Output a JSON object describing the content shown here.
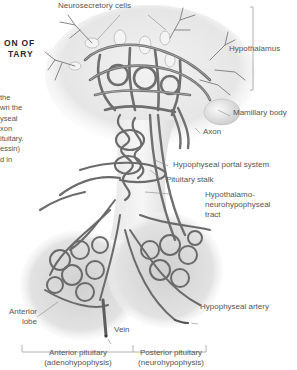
{
  "title": {
    "lines": [
      "ON OF",
      "TARY"
    ]
  },
  "body_text": {
    "lines": [
      "the",
      "wri the",
      "yseal",
      "xon",
      "ituitary.",
      "essin)",
      "d in"
    ]
  },
  "labels": {
    "neurosecretory_cells": "Neurosecretory cells",
    "hypothalamus": "Hypothalamus",
    "mamillary_body": "Mamillary body",
    "axon": "Axon",
    "hypophyseal_portal_system": "Hypophyseal portal system",
    "pituitary_stalk": "Pituitary stalk",
    "hypothalamo_tract": [
      "Hypothalamo-",
      "neurohypophyseal",
      "tract"
    ],
    "hypophyseal_artery": "Hypophyseal artery",
    "anterior_lobe": [
      "Anterior",
      "lobe"
    ],
    "vein": "Vein",
    "anterior_pituitary": [
      "Anterior pituitary",
      "(adenohypophysis)"
    ],
    "posterior_pituitary": [
      "Posterior pituitary",
      "(neurohypophysis)"
    ]
  },
  "colors": {
    "vessel": "#6e6e6e",
    "vessel_highlight": "#a8a8a8",
    "tissue": "#e4e4e4",
    "leader_line": "#8a8a8a",
    "bracket": "#a0a0a0"
  }
}
